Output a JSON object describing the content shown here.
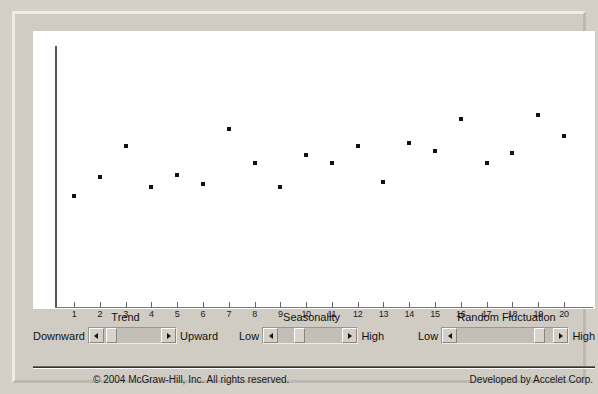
{
  "chart_data": {
    "type": "scatter",
    "title": "",
    "xlabel": "",
    "ylabel": "",
    "grid": false,
    "legend": false,
    "xlim": [
      0.5,
      20.5
    ],
    "ylim": [
      0,
      10
    ],
    "x": [
      1,
      2,
      3,
      4,
      5,
      6,
      7,
      8,
      9,
      10,
      11,
      12,
      13,
      14,
      15,
      16,
      17,
      18,
      19,
      20
    ],
    "xtick_labels": [
      "1",
      "2",
      "3",
      "4",
      "5",
      "6",
      "7",
      "8",
      "9",
      "10",
      "11",
      "12",
      "13",
      "14",
      "15",
      "16",
      "17",
      "18",
      "19",
      "20"
    ],
    "ytick_labels": [],
    "series": [
      {
        "name": "Simulated Time Series",
        "values": [
          4.2,
          5.0,
          6.3,
          4.6,
          5.1,
          4.7,
          7.0,
          5.6,
          4.6,
          5.9,
          5.6,
          6.3,
          4.8,
          6.4,
          6.1,
          7.4,
          5.6,
          6.0,
          7.6,
          6.7
        ]
      }
    ],
    "marker_color": "#111111"
  },
  "controls": {
    "trend": {
      "title": "Trend",
      "left_label": "Downward",
      "right_label": "Upward",
      "value_pct": 5,
      "left_arrow_icon": "arrow-left-icon",
      "right_arrow_icon": "arrow-right-icon"
    },
    "seasonality": {
      "title": "Seasonality",
      "left_label": "Low",
      "right_label": "High",
      "value_pct": 28,
      "left_arrow_icon": "arrow-left-icon",
      "right_arrow_icon": "arrow-right-icon"
    },
    "random_fluctuation": {
      "title": "Random Fluctuation",
      "left_label": "Low",
      "right_label": "High",
      "value_pct": 88,
      "left_arrow_icon": "arrow-left-icon",
      "right_arrow_icon": "arrow-right-icon"
    }
  },
  "footer": {
    "copyright": "© 2004 McGraw-Hill, Inc. All rights reserved.",
    "developer": "Developed by Accelet Corp."
  },
  "colors": {
    "panel": "#d4d0c8",
    "plot_background": "#ffffff",
    "axis": "#555555",
    "marker": "#111111"
  }
}
